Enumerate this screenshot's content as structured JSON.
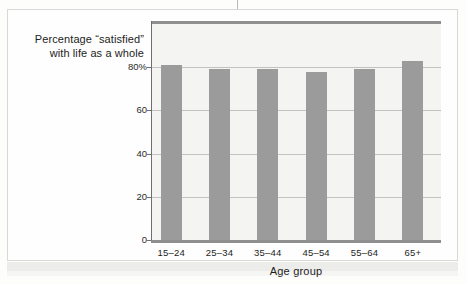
{
  "caption": {
    "line1": "Percentage “satisfied”",
    "line2": "with life as a whole"
  },
  "chart_data": {
    "type": "bar",
    "title": "",
    "categories": [
      "15–24",
      "25–34",
      "35–44",
      "45–54",
      "55–64",
      "65+"
    ],
    "values": [
      81,
      79,
      79,
      78,
      79,
      83
    ],
    "xlabel": "Age group",
    "ylabel": "Percentage “satisfied” with life as a whole",
    "ylim": [
      0,
      100
    ],
    "yticks": [
      0,
      20,
      40,
      60,
      80
    ],
    "ytick_labels": [
      "0",
      "20",
      "40",
      "60",
      "80%"
    ],
    "grid": true,
    "legend": "none",
    "bar_color": "#9b9b9b",
    "plot_background": "#f4f4f2",
    "axis_color": "#8f8f8f",
    "gridline_color": "#c2c2c0"
  }
}
